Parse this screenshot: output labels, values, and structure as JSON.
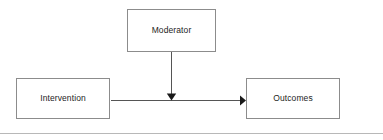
{
  "diagram": {
    "background_color": "#ffffff",
    "node_border_color": "#8c8c8c",
    "edge_color": "#555555",
    "text_color": "#1d1d1d",
    "nodes": [
      {
        "id": "moderator",
        "label": "Moderator",
        "shape": "rectangle",
        "x": 127,
        "y": 9,
        "width": 89,
        "height": 43
      },
      {
        "id": "intervention",
        "label": "Intervention",
        "shape": "rectangle",
        "x": 16,
        "y": 78,
        "width": 94,
        "height": 41
      },
      {
        "id": "outcomes",
        "label": "Outcomes",
        "shape": "rectangle",
        "x": 246,
        "y": 78,
        "width": 94,
        "height": 41
      }
    ],
    "edges": [
      {
        "id": "intervention-to-outcomes",
        "from": "intervention",
        "to": "outcomes",
        "label": "",
        "direction": "right",
        "arrowhead": "filled-triangle"
      },
      {
        "id": "moderator-to-path",
        "from": "moderator",
        "to": "intervention-to-outcomes",
        "label": "",
        "direction": "down",
        "arrowhead": "filled-triangle"
      }
    ]
  },
  "footer": {
    "rule_color": "#b8b8b8"
  }
}
